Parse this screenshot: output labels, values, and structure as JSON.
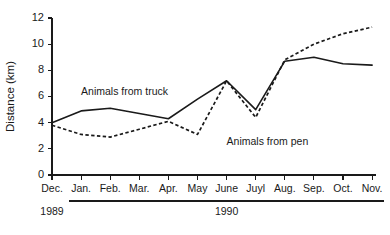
{
  "chart_data": {
    "type": "line",
    "title": "",
    "xlabel": "",
    "ylabel": "Distance (km)",
    "ylim": [
      0,
      12
    ],
    "ytick_values": [
      0,
      2,
      4,
      6,
      8,
      10,
      12
    ],
    "ytick_labels": [
      "0",
      "2",
      "4",
      "6",
      "8",
      "10",
      "12"
    ],
    "grid": false,
    "legend_position": "inline-annotations",
    "categories": [
      "Dec.",
      "Jan.",
      "Feb.",
      "Mar.",
      "Apr.",
      "May",
      "June",
      "Juyl",
      "Aug.",
      "Sep.",
      "Oct.",
      "Nov."
    ],
    "series": [
      {
        "name": "Animals from truck",
        "style": "solid",
        "values": [
          4.0,
          4.9,
          5.1,
          4.7,
          4.3,
          5.8,
          7.2,
          5.0,
          8.7,
          9.0,
          8.5,
          8.4
        ]
      },
      {
        "name": "Animals from pen",
        "style": "dashed",
        "values": [
          3.8,
          3.1,
          2.9,
          3.5,
          4.1,
          3.1,
          7.2,
          4.4,
          8.8,
          10.0,
          10.8,
          11.3
        ]
      }
    ],
    "annotations": [
      {
        "text": "Animals from truck",
        "x_category": "Jan.",
        "y_value": 6.1
      },
      {
        "text": "Animals from pen",
        "x_category": "June",
        "y_value": 2.3
      }
    ],
    "year_groups": [
      {
        "label": "1989",
        "categories": [
          "Dec."
        ],
        "rule": false
      },
      {
        "label": "1990",
        "categories": [
          "Jan.",
          "Feb.",
          "Mar.",
          "Apr.",
          "May",
          "June",
          "Juyl",
          "Aug.",
          "Sep.",
          "Oct.",
          "Nov."
        ],
        "rule": true
      }
    ],
    "colors": {
      "ink": "#1a1a1a",
      "background": "#ffffff"
    }
  }
}
